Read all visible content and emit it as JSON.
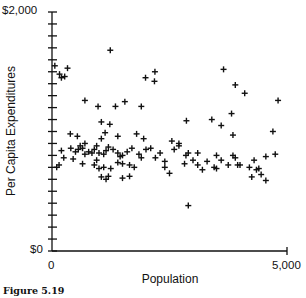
{
  "caption": "Figure 5.19",
  "chart_data": {
    "type": "scatter",
    "title": "",
    "xlabel": "Population",
    "ylabel": "Per Capita Expenditures",
    "xlim": [
      0,
      5000
    ],
    "ylim": [
      0,
      2000
    ],
    "x_tick_labels": [
      "0",
      "5,000"
    ],
    "y_tick_labels": [
      "$0",
      "$2,000"
    ],
    "y_minor_tick_step": 100,
    "grid": false,
    "legend": null,
    "marker": "plus",
    "series": [
      {
        "name": "Counties",
        "points": [
          [
            60,
            1550
          ],
          [
            330,
            1530
          ],
          [
            160,
            1480
          ],
          [
            270,
            1460
          ],
          [
            200,
            1450
          ],
          [
            1240,
            1680
          ],
          [
            1990,
            1450
          ],
          [
            2190,
            1500
          ],
          [
            2180,
            1420
          ],
          [
            3650,
            1520
          ],
          [
            3900,
            1390
          ],
          [
            4100,
            1320
          ],
          [
            4810,
            1260
          ],
          [
            700,
            1260
          ],
          [
            1550,
            1250
          ],
          [
            1230,
            1060
          ],
          [
            1900,
            1210
          ],
          [
            980,
            1210
          ],
          [
            1350,
            1210
          ],
          [
            3820,
            1150
          ],
          [
            3400,
            1100
          ],
          [
            3600,
            1050
          ],
          [
            2860,
            1090
          ],
          [
            1050,
            1080
          ],
          [
            390,
            980
          ],
          [
            540,
            960
          ],
          [
            1050,
            940
          ],
          [
            1130,
            990
          ],
          [
            1400,
            960
          ],
          [
            1800,
            980
          ],
          [
            1950,
            940
          ],
          [
            2550,
            920
          ],
          [
            2700,
            900
          ],
          [
            3850,
            970
          ],
          [
            4700,
            1000
          ],
          [
            200,
            840
          ],
          [
            400,
            860
          ],
          [
            500,
            830
          ],
          [
            560,
            850
          ],
          [
            600,
            880
          ],
          [
            650,
            860
          ],
          [
            700,
            900
          ],
          [
            780,
            830
          ],
          [
            850,
            820
          ],
          [
            900,
            850
          ],
          [
            950,
            880
          ],
          [
            1000,
            820
          ],
          [
            1100,
            810
          ],
          [
            1150,
            840
          ],
          [
            1200,
            870
          ],
          [
            1300,
            850
          ],
          [
            1400,
            820
          ],
          [
            1450,
            790
          ],
          [
            1500,
            800
          ],
          [
            1600,
            830
          ],
          [
            1700,
            860
          ],
          [
            1850,
            810
          ],
          [
            1900,
            780
          ],
          [
            2000,
            850
          ],
          [
            2100,
            860
          ],
          [
            2200,
            780
          ],
          [
            2300,
            820
          ],
          [
            2400,
            750
          ],
          [
            2600,
            850
          ],
          [
            2700,
            880
          ],
          [
            2850,
            800
          ],
          [
            2900,
            820
          ],
          [
            3000,
            760
          ],
          [
            3100,
            820
          ],
          [
            3300,
            750
          ],
          [
            3500,
            800
          ],
          [
            3600,
            760
          ],
          [
            3750,
            720
          ],
          [
            3850,
            800
          ],
          [
            3900,
            780
          ],
          [
            4000,
            720
          ],
          [
            4200,
            700
          ],
          [
            4300,
            760
          ],
          [
            4400,
            690
          ],
          [
            4550,
            790
          ],
          [
            4750,
            810
          ],
          [
            250,
            780
          ],
          [
            450,
            770
          ],
          [
            650,
            730
          ],
          [
            900,
            720
          ],
          [
            1100,
            700
          ],
          [
            1250,
            690
          ],
          [
            1400,
            740
          ],
          [
            1500,
            730
          ],
          [
            1650,
            720
          ],
          [
            1750,
            700
          ],
          [
            2400,
            700
          ],
          [
            2500,
            650
          ],
          [
            2820,
            730
          ],
          [
            3100,
            720
          ],
          [
            3200,
            680
          ],
          [
            3450,
            700
          ],
          [
            3950,
            720
          ],
          [
            4350,
            680
          ],
          [
            4550,
            590
          ],
          [
            4250,
            620
          ],
          [
            1500,
            610
          ],
          [
            1650,
            625
          ],
          [
            1000,
            690
          ],
          [
            1050,
            620
          ],
          [
            1150,
            600
          ],
          [
            1200,
            625
          ],
          [
            2900,
            380
          ],
          [
            100,
            700
          ],
          [
            150,
            720
          ],
          [
            3500,
            690
          ],
          [
            4450,
            640
          ],
          [
            700,
            810
          ],
          [
            950,
            760
          ]
        ]
      }
    ]
  }
}
